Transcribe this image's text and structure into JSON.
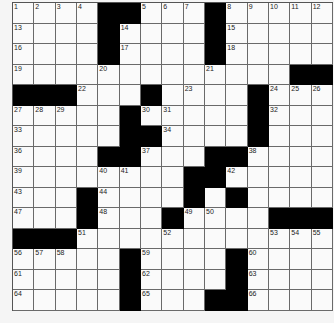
{
  "puzzle": {
    "rows": 15,
    "cols": 15,
    "layout": [
      "....##...#.....",
      "....#....#.....",
      "....#....#.....",
      ".............##",
      "###...#....#...",
      ".....#.....#...",
      ".....##....#...",
      "....##...##....",
      "........##.....",
      "...#....#.#....",
      "...#...#....###",
      "###............",
      ".....#....#....",
      ".....#....#....",
      ".....#...##...."
    ],
    "numbers": [
      {
        "r": 0,
        "c": 0,
        "n": "1"
      },
      {
        "r": 0,
        "c": 1,
        "n": "2"
      },
      {
        "r": 0,
        "c": 2,
        "n": "3"
      },
      {
        "r": 0,
        "c": 3,
        "n": "4"
      },
      {
        "r": 0,
        "c": 6,
        "n": "5"
      },
      {
        "r": 0,
        "c": 7,
        "n": "6"
      },
      {
        "r": 0,
        "c": 8,
        "n": "7"
      },
      {
        "r": 0,
        "c": 10,
        "n": "8"
      },
      {
        "r": 0,
        "c": 11,
        "n": "9"
      },
      {
        "r": 0,
        "c": 12,
        "n": "10"
      },
      {
        "r": 0,
        "c": 13,
        "n": "11"
      },
      {
        "r": 0,
        "c": 14,
        "n": "12"
      },
      {
        "r": 1,
        "c": 0,
        "n": "13"
      },
      {
        "r": 1,
        "c": 5,
        "n": "14"
      },
      {
        "r": 1,
        "c": 10,
        "n": "15"
      },
      {
        "r": 2,
        "c": 0,
        "n": "16"
      },
      {
        "r": 2,
        "c": 5,
        "n": "17"
      },
      {
        "r": 2,
        "c": 10,
        "n": "18"
      },
      {
        "r": 3,
        "c": 0,
        "n": "19"
      },
      {
        "r": 3,
        "c": 4,
        "n": "20"
      },
      {
        "r": 3,
        "c": 9,
        "n": "21"
      },
      {
        "r": 4,
        "c": 3,
        "n": "22"
      },
      {
        "r": 4,
        "c": 8,
        "n": "23"
      },
      {
        "r": 4,
        "c": 12,
        "n": "24"
      },
      {
        "r": 4,
        "c": 13,
        "n": "25"
      },
      {
        "r": 4,
        "c": 14,
        "n": "26"
      },
      {
        "r": 5,
        "c": 0,
        "n": "27"
      },
      {
        "r": 5,
        "c": 1,
        "n": "28"
      },
      {
        "r": 5,
        "c": 2,
        "n": "29"
      },
      {
        "r": 5,
        "c": 6,
        "n": "30"
      },
      {
        "r": 5,
        "c": 7,
        "n": "31"
      },
      {
        "r": 5,
        "c": 12,
        "n": "32"
      },
      {
        "r": 6,
        "c": 0,
        "n": "33"
      },
      {
        "r": 6,
        "c": 7,
        "n": "34"
      },
      {
        "r": 6,
        "c": 11,
        "n": "35"
      },
      {
        "r": 7,
        "c": 0,
        "n": "36"
      },
      {
        "r": 7,
        "c": 6,
        "n": "37"
      },
      {
        "r": 7,
        "c": 11,
        "n": "38"
      },
      {
        "r": 8,
        "c": 0,
        "n": "39"
      },
      {
        "r": 8,
        "c": 4,
        "n": "40"
      },
      {
        "r": 8,
        "c": 5,
        "n": "41"
      },
      {
        "r": 8,
        "c": 10,
        "n": "42"
      },
      {
        "r": 9,
        "c": 0,
        "n": "43"
      },
      {
        "r": 9,
        "c": 4,
        "n": "44"
      },
      {
        "r": 9,
        "c": 8,
        "n": "45"
      },
      {
        "r": 9,
        "c": 10,
        "n": "46"
      },
      {
        "r": 10,
        "c": 0,
        "n": "47"
      },
      {
        "r": 10,
        "c": 4,
        "n": "48"
      },
      {
        "r": 10,
        "c": 8,
        "n": "49"
      },
      {
        "r": 10,
        "c": 9,
        "n": "50"
      },
      {
        "r": 11,
        "c": 3,
        "n": "51"
      },
      {
        "r": 11,
        "c": 7,
        "n": "52"
      },
      {
        "r": 11,
        "c": 12,
        "n": "53"
      },
      {
        "r": 11,
        "c": 13,
        "n": "54"
      },
      {
        "r": 11,
        "c": 14,
        "n": "55"
      },
      {
        "r": 12,
        "c": 0,
        "n": "56"
      },
      {
        "r": 12,
        "c": 1,
        "n": "57"
      },
      {
        "r": 12,
        "c": 2,
        "n": "58"
      },
      {
        "r": 12,
        "c": 6,
        "n": "59"
      },
      {
        "r": 12,
        "c": 11,
        "n": "60"
      },
      {
        "r": 13,
        "c": 0,
        "n": "61"
      },
      {
        "r": 13,
        "c": 6,
        "n": "62"
      },
      {
        "r": 13,
        "c": 11,
        "n": "63"
      },
      {
        "r": 14,
        "c": 0,
        "n": "64"
      },
      {
        "r": 14,
        "c": 6,
        "n": "65"
      },
      {
        "r": 14,
        "c": 11,
        "n": "66"
      }
    ]
  }
}
